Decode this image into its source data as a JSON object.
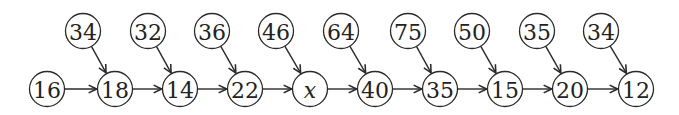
{
  "diagram": {
    "type": "flow-chain",
    "colors": {
      "stroke": "#2a2a2a",
      "text": "#222222",
      "background": "#ffffff"
    },
    "bottom_nodes": [
      {
        "id": "b0",
        "label": "16",
        "x": 47
      },
      {
        "id": "b1",
        "label": "18",
        "x": 115
      },
      {
        "id": "b2",
        "label": "14",
        "x": 180
      },
      {
        "id": "b3",
        "label": "22",
        "x": 245
      },
      {
        "id": "b4",
        "label": "x",
        "x": 310,
        "italic": true
      },
      {
        "id": "b5",
        "label": "40",
        "x": 375
      },
      {
        "id": "b6",
        "label": "35",
        "x": 440
      },
      {
        "id": "b7",
        "label": "15",
        "x": 505
      },
      {
        "id": "b8",
        "label": "20",
        "x": 570
      },
      {
        "id": "b9",
        "label": "12",
        "x": 636
      }
    ],
    "top_nodes": [
      {
        "id": "t1",
        "label": "34",
        "x": 83,
        "target": "b1"
      },
      {
        "id": "t2",
        "label": "32",
        "x": 148,
        "target": "b2"
      },
      {
        "id": "t3",
        "label": "36",
        "x": 212,
        "target": "b3"
      },
      {
        "id": "t4",
        "label": "46",
        "x": 276,
        "target": "b4"
      },
      {
        "id": "t5",
        "label": "64",
        "x": 341,
        "target": "b5"
      },
      {
        "id": "t6",
        "label": "75",
        "x": 408,
        "target": "b6"
      },
      {
        "id": "t7",
        "label": "50",
        "x": 472,
        "target": "b7"
      },
      {
        "id": "t8",
        "label": "35",
        "x": 537,
        "target": "b8"
      },
      {
        "id": "t9",
        "label": "34",
        "x": 601,
        "target": "b9"
      }
    ],
    "layout": {
      "bottom_y": 89,
      "top_y": 31,
      "radius": 17.5
    }
  }
}
